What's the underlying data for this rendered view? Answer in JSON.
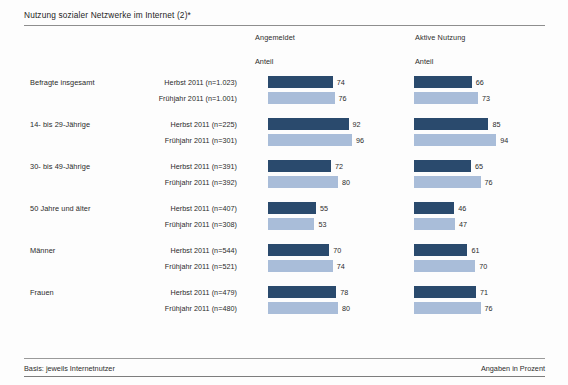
{
  "title": "Nutzung sozialer Netzwerke im Internet (2)*",
  "columns": [
    {
      "header": "Angemeldet",
      "sub": "Anteil"
    },
    {
      "header": "Aktive Nutzung",
      "sub": "Anteil"
    }
  ],
  "footer": {
    "left": "Basis: jeweils Internetnutzer",
    "right": "Angaben in Prozent"
  },
  "colors": {
    "dark": "#2a4a6d",
    "light": "#a9bdd9",
    "rule": "#8e8e8e",
    "background": "#fdfdfd",
    "text": "#2a2a2a"
  },
  "chart_data": {
    "type": "bar",
    "title": "Nutzung sozialer Netzwerke im Internet (2)*",
    "xlabel": "",
    "ylabel": "",
    "xlim": [
      0,
      100
    ],
    "grid": false,
    "orientation": "horizontal",
    "value_unit": "percent",
    "note_basis": "Basis: jeweils Internetnutzer",
    "note_units": "Angaben in Prozent",
    "panels": [
      "Angemeldet",
      "Aktive Nutzung"
    ],
    "series": [
      {
        "name": "Herbst 2011",
        "color": "#2a4a6d"
      },
      {
        "name": "Frühjahr 2011",
        "color": "#a9bdd9"
      }
    ],
    "groups": [
      {
        "label": "Befragte insgesamt",
        "rows": [
          {
            "series": "Herbst 2011",
            "label": "Herbst 2011 (n=1.023)",
            "style": "dark",
            "angemeldet": 74,
            "aktive_nutzung": 66
          },
          {
            "series": "Frühjahr 2011",
            "label": "Frühjahr 2011 (n=1.001)",
            "style": "light",
            "angemeldet": 76,
            "aktive_nutzung": 73
          }
        ]
      },
      {
        "label": "14- bis 29-Jährige",
        "rows": [
          {
            "series": "Herbst 2011",
            "label": "Herbst 2011 (n=225)",
            "style": "dark",
            "angemeldet": 92,
            "aktive_nutzung": 85
          },
          {
            "series": "Frühjahr 2011",
            "label": "Frühjahr 2011 (n=301)",
            "style": "light",
            "angemeldet": 96,
            "aktive_nutzung": 94
          }
        ]
      },
      {
        "label": "30- bis 49-Jährige",
        "rows": [
          {
            "series": "Herbst 2011",
            "label": "Herbst 2011 (n=391)",
            "style": "dark",
            "angemeldet": 72,
            "aktive_nutzung": 65
          },
          {
            "series": "Frühjahr 2011",
            "label": "Frühjahr 2011 (n=392)",
            "style": "light",
            "angemeldet": 80,
            "aktive_nutzung": 76
          }
        ]
      },
      {
        "label": "50 Jahre und älter",
        "rows": [
          {
            "series": "Herbst 2011",
            "label": "Herbst 2011 (n=407)",
            "style": "dark",
            "angemeldet": 55,
            "aktive_nutzung": 46
          },
          {
            "series": "Frühjahr 2011",
            "label": "Frühjahr 2011 (n=308)",
            "style": "light",
            "angemeldet": 53,
            "aktive_nutzung": 47
          }
        ]
      },
      {
        "label": "Männer",
        "rows": [
          {
            "series": "Herbst 2011",
            "label": "Herbst 2011 (n=544)",
            "style": "dark",
            "angemeldet": 70,
            "aktive_nutzung": 61
          },
          {
            "series": "Frühjahr 2011",
            "label": "Frühjahr 2011 (n=521)",
            "style": "light",
            "angemeldet": 74,
            "aktive_nutzung": 70
          }
        ]
      },
      {
        "label": "Frauen",
        "rows": [
          {
            "series": "Herbst 2011",
            "label": "Herbst 2011 (n=479)",
            "style": "dark",
            "angemeldet": 78,
            "aktive_nutzung": 71
          },
          {
            "series": "Frühjahr 2011",
            "label": "Frühjahr 2011 (n=480)",
            "style": "light",
            "angemeldet": 80,
            "aktive_nutzung": 76
          }
        ]
      }
    ]
  }
}
